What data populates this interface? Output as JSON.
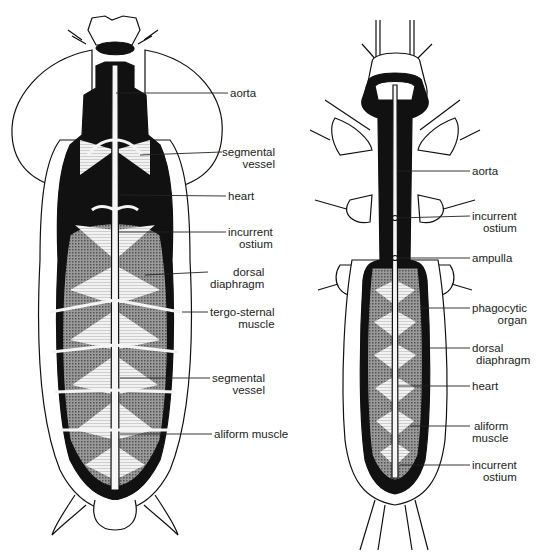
{
  "figure": {
    "left_specimen": {
      "labels": [
        {
          "id": "aorta",
          "lines": [
            "aorta"
          ]
        },
        {
          "id": "segmental-vessel-upper",
          "lines": [
            "segmental",
            "vessel"
          ]
        },
        {
          "id": "heart",
          "lines": [
            "heart"
          ]
        },
        {
          "id": "incurrent-ostium",
          "lines": [
            "incurrent",
            "ostium"
          ]
        },
        {
          "id": "dorsal-diaphragm",
          "lines": [
            "dorsal",
            "diaphragm"
          ]
        },
        {
          "id": "tergo-sternal-muscle",
          "lines": [
            "tergo-sternal",
            "muscle"
          ]
        },
        {
          "id": "segmental-vessel-lower",
          "lines": [
            "segmental",
            "vessel"
          ]
        },
        {
          "id": "aliform-muscle",
          "lines": [
            "aliform muscle"
          ]
        }
      ]
    },
    "right_specimen": {
      "labels": [
        {
          "id": "aorta",
          "lines": [
            "aorta"
          ]
        },
        {
          "id": "incurrent-ostium-upper",
          "lines": [
            "incurrent",
            "ostium"
          ]
        },
        {
          "id": "ampulla",
          "lines": [
            "ampulla"
          ]
        },
        {
          "id": "phagocytic-organ",
          "lines": [
            "phagocytic",
            "organ"
          ]
        },
        {
          "id": "dorsal-diaphragm",
          "lines": [
            "dorsal",
            "diaphragm"
          ]
        },
        {
          "id": "heart",
          "lines": [
            "heart"
          ]
        },
        {
          "id": "aliform-muscle",
          "lines": [
            "aliform",
            "muscle"
          ]
        },
        {
          "id": "incurrent-ostium-lower",
          "lines": [
            "incurrent",
            "ostium"
          ]
        }
      ]
    },
    "colors": {
      "ink": "#111111",
      "paper": "#ffffff",
      "stipple": "#8a8a8a",
      "muscle": "#d8d8d8"
    }
  }
}
